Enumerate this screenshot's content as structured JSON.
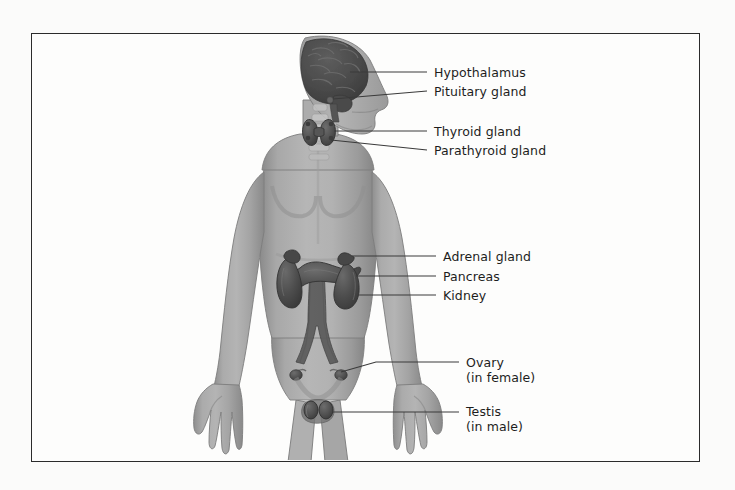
{
  "figure": {
    "frame": {
      "x": 31,
      "y": 33,
      "width": 669,
      "height": 429,
      "border_color": "#2b2b2b"
    },
    "background_color": "#fbfbfa",
    "canvas_color": "#fdfdfc"
  },
  "colors": {
    "body_fill": "#a2a2a2",
    "body_shadow": "#8d8d8d",
    "body_highlight": "#b8b8b8",
    "body_outline": "#6e6e6e",
    "organ_dark": "#4a4a4a",
    "organ_mid": "#5d5d5d",
    "organ_light": "#6f6f6f",
    "brain_fill": "#4f4f4f",
    "leader_line": "#3a3a3a",
    "text": "#1d1d1d"
  },
  "labels": [
    {
      "id": "hypothalamus",
      "name": "Hypothalamus",
      "sub": "",
      "text_x": 434,
      "text_y": 65,
      "line": {
        "x1": 350,
        "y1": 72,
        "x2": 427,
        "y2": 72
      }
    },
    {
      "id": "pituitary-gland",
      "name": "Pituitary gland",
      "sub": "",
      "text_x": 434,
      "text_y": 84,
      "line": {
        "x1": 342,
        "y1": 91,
        "x2": 427,
        "y2": 91
      }
    },
    {
      "id": "thyroid-gland",
      "name": "Thyroid gland",
      "sub": "",
      "text_x": 434,
      "text_y": 124,
      "line": {
        "x1": 336,
        "y1": 131,
        "x2": 427,
        "y2": 131
      }
    },
    {
      "id": "parathyroid-gland",
      "name": "Parathyroid gland",
      "sub": "",
      "text_x": 434,
      "text_y": 143,
      "line": {
        "x1": 331,
        "y1": 150,
        "x2": 427,
        "y2": 150
      }
    },
    {
      "id": "adrenal-gland",
      "name": "Adrenal gland",
      "sub": "",
      "text_x": 443,
      "text_y": 249,
      "line": {
        "x1": 352,
        "y1": 256,
        "x2": 436,
        "y2": 256
      }
    },
    {
      "id": "pancreas",
      "name": "Pancreas",
      "sub": "",
      "text_x": 443,
      "text_y": 269,
      "line": {
        "x1": 358,
        "y1": 276,
        "x2": 436,
        "y2": 276
      }
    },
    {
      "id": "kidney",
      "name": "Kidney",
      "sub": "",
      "text_x": 443,
      "text_y": 288,
      "line": {
        "x1": 362,
        "y1": 295,
        "x2": 436,
        "y2": 295
      }
    },
    {
      "id": "ovary",
      "name": "Ovary",
      "sub": "(in female)",
      "text_x": 466,
      "text_y": 356,
      "line": {
        "x1": 345,
        "y1": 370,
        "x2": 459,
        "y2": 363
      }
    },
    {
      "id": "testis",
      "name": "Testis",
      "sub": "(in male)",
      "text_x": 466,
      "text_y": 405,
      "line": {
        "x1": 342,
        "y1": 412,
        "x2": 459,
        "y2": 412
      }
    }
  ],
  "organs": [
    {
      "id": "brain",
      "label": "brain"
    },
    {
      "id": "pituitary",
      "label": "pituitary gland"
    },
    {
      "id": "thyroid",
      "label": "thyroid gland"
    },
    {
      "id": "parathyroid",
      "label": "parathyroid gland"
    },
    {
      "id": "adrenal-left",
      "label": "left adrenal gland"
    },
    {
      "id": "adrenal-right",
      "label": "right adrenal gland"
    },
    {
      "id": "kidney-left",
      "label": "left kidney"
    },
    {
      "id": "kidney-right",
      "label": "right kidney"
    },
    {
      "id": "pancreas-organ",
      "label": "pancreas"
    },
    {
      "id": "aorta",
      "label": "aorta"
    },
    {
      "id": "ovary-left",
      "label": "left ovary"
    },
    {
      "id": "ovary-right",
      "label": "right ovary"
    },
    {
      "id": "testes",
      "label": "testes"
    }
  ]
}
